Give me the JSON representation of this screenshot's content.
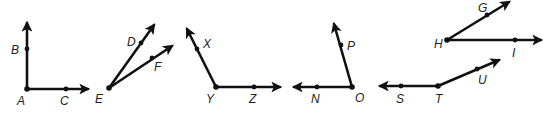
{
  "diagram": {
    "color": "#111111",
    "angles": [
      {
        "name": "angle-BAC",
        "vertex": {
          "label": "A",
          "x": 27,
          "y": 89,
          "lx": 17,
          "ly": 105
        },
        "rays": [
          {
            "point": {
              "label": "B",
              "x": 27,
              "y": 49,
              "lx": 11,
              "ly": 54
            },
            "tip": {
              "x": 27,
              "y": 23
            }
          },
          {
            "point": {
              "label": "C",
              "x": 66,
              "y": 89,
              "lx": 60,
              "ly": 105
            },
            "tip": {
              "x": 88,
              "y": 89
            }
          }
        ]
      },
      {
        "name": "angle-DEF",
        "vertex": {
          "label": "E",
          "x": 109,
          "y": 88,
          "lx": 95,
          "ly": 103
        },
        "rays": [
          {
            "point": {
              "label": "D",
              "x": 141,
              "y": 43,
              "lx": 127,
              "ly": 46
            },
            "tip": {
              "x": 154,
              "y": 25
            }
          },
          {
            "point": {
              "label": "F",
              "x": 152,
              "y": 58,
              "lx": 154,
              "ly": 71
            },
            "tip": {
              "x": 172,
              "y": 46
            }
          }
        ]
      },
      {
        "name": "angle-XYZ",
        "vertex": {
          "label": "Y",
          "x": 216,
          "y": 87,
          "lx": 206,
          "ly": 103
        },
        "rays": [
          {
            "point": {
              "label": "X",
              "x": 197,
              "y": 49,
              "lx": 203,
              "ly": 48
            },
            "tip": {
              "x": 187,
              "y": 29
            }
          },
          {
            "point": {
              "label": "Z",
              "x": 254,
              "y": 87,
              "lx": 249,
              "ly": 103
            },
            "tip": {
              "x": 280,
              "y": 87
            }
          }
        ]
      },
      {
        "name": "angle-NOP",
        "vertex": {
          "label": "O",
          "x": 352,
          "y": 87,
          "lx": 355,
          "ly": 102
        },
        "rays": [
          {
            "point": {
              "label": "P",
              "x": 341,
              "y": 45,
              "lx": 347,
              "ly": 50
            },
            "tip": {
              "x": 334,
              "y": 24
            }
          },
          {
            "point": {
              "label": "N",
              "x": 317,
              "y": 87,
              "lx": 311,
              "ly": 103
            },
            "tip": {
              "x": 294,
              "y": 87
            }
          }
        ]
      },
      {
        "name": "angle-GHI",
        "vertex": {
          "label": "H",
          "x": 447,
          "y": 40,
          "lx": 434,
          "ly": 48
        },
        "rays": [
          {
            "point": {
              "label": "G",
              "x": 487,
              "y": 15,
              "lx": 478,
              "ly": 12
            },
            "tip": {
              "x": 509,
              "y": 2
            }
          },
          {
            "point": {
              "label": "I",
              "x": 515,
              "y": 40,
              "lx": 512,
              "ly": 57
            },
            "tip": {
              "x": 541,
              "y": 40
            }
          }
        ]
      },
      {
        "name": "angle-STU",
        "vertex": {
          "label": "T",
          "x": 438,
          "y": 86,
          "lx": 435,
          "ly": 103
        },
        "rays": [
          {
            "point": {
              "label": "S",
              "x": 401,
              "y": 86,
              "lx": 396,
              "ly": 103
            },
            "tip": {
              "x": 380,
              "y": 86
            }
          },
          {
            "point": {
              "label": "U",
              "x": 477,
              "y": 69,
              "lx": 478,
              "ly": 84
            },
            "tip": {
              "x": 499,
              "y": 60
            }
          }
        ]
      }
    ]
  }
}
